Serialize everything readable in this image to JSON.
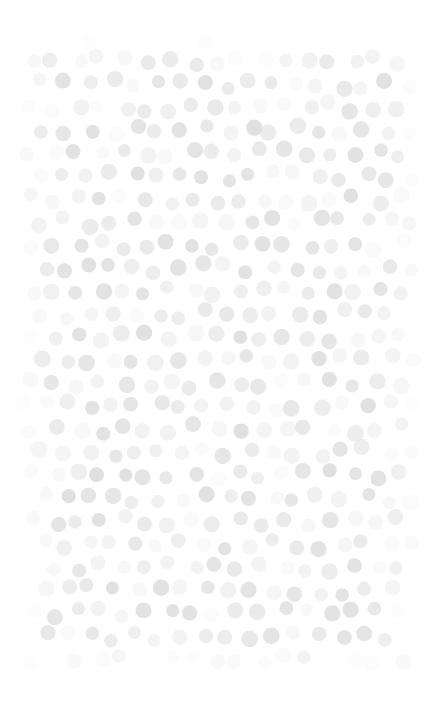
{
  "canvas": {
    "width": 440,
    "height": 712,
    "background_color": "#ffffff"
  },
  "pattern": {
    "name": "dot-field",
    "description": "Decorative scattered dot texture",
    "shape": "circle",
    "dot_color": "#e0e0e0",
    "dot_diameter": 15,
    "grid_pitch_x": 23,
    "grid_pitch_y": 23,
    "jitter": 5,
    "field_left": 20,
    "field_top": 38,
    "field_right": 420,
    "field_bottom": 670,
    "opacity_min": 0.12,
    "opacity_max": 1.0,
    "edge_falloff": 34,
    "seed": 20240517
  }
}
